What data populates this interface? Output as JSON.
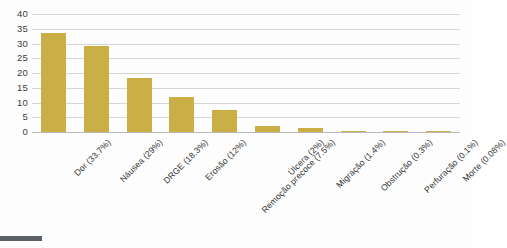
{
  "chart_data": {
    "type": "bar",
    "title": "",
    "subtitle": "",
    "xlabel": "",
    "ylabel": "",
    "ylim": [
      0,
      40
    ],
    "ytick_step": 5,
    "yticks": [
      0,
      5,
      10,
      15,
      20,
      25,
      30,
      35,
      40
    ],
    "ytick_labels": [
      "0",
      "5",
      "10",
      "15",
      "20",
      "25",
      "30",
      "35",
      "40"
    ],
    "grid": true,
    "grid_axis": "y",
    "legend": false,
    "legend_position": "none",
    "bar_color": "#c9af45",
    "categories": [
      "Dor (33.7%)",
      "Náusea (29%)",
      "DRGE (18.3%)",
      "Erosão (12%)",
      "Remoção precoce (7.5%)",
      "Úlcera (2%)",
      "Migração (1.4%)",
      "Obstrução (0.3%)",
      "Perfuração (0.1%)",
      "Morte (0.08%)"
    ],
    "values": [
      33.7,
      29,
      18.3,
      12,
      7.5,
      2,
      1.4,
      0.3,
      0.1,
      0.08
    ]
  },
  "colors": {
    "bar": "#c9af45",
    "gridline": "#d6d6d6",
    "baseline": "#b8b8b8",
    "tick_text": "#3b3b3b",
    "category_text": "#333333",
    "background": "#fdfdfd",
    "bottom_strip": "#5c6168"
  }
}
